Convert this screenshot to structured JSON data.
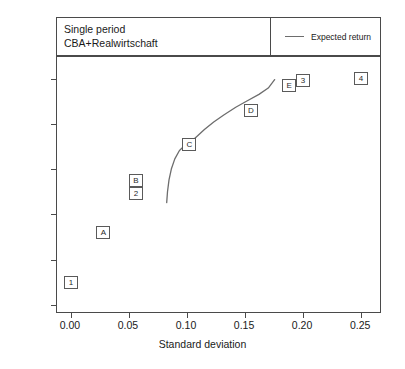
{
  "header": {
    "title_lines": [
      "Single period",
      "CBA+Realwirtschaft"
    ],
    "legend": {
      "label": "Expected return",
      "color": "#6d6d6d"
    }
  },
  "axes": {
    "x_title": "Standard deviation",
    "x_ticks": [
      "0.00",
      "0.05",
      "0.10",
      "0.15",
      "0.20",
      "0.25"
    ],
    "y_ticks": [
      "0.00",
      "0.02",
      "0.04",
      "0.06",
      "0.08",
      "0.10"
    ]
  },
  "chart_data": {
    "type": "scatter",
    "title": "Single period CBA+Realwirtschaft",
    "xlabel": "Standard deviation",
    "ylabel": "",
    "xlim": [
      -0.012,
      0.268
    ],
    "ylim": [
      -0.004,
      0.1095
    ],
    "grid": false,
    "legend_position": "top-right",
    "legend": [
      {
        "name": "Expected return",
        "type": "line",
        "color": "#6d6d6d"
      }
    ],
    "points": [
      {
        "label": "1",
        "x": 0.0,
        "y": 0.01
      },
      {
        "label": "A",
        "x": 0.028,
        "y": 0.032
      },
      {
        "label": "B",
        "x": 0.056,
        "y": 0.055
      },
      {
        "label": "2",
        "x": 0.056,
        "y": 0.049
      },
      {
        "label": "C",
        "x": 0.102,
        "y": 0.071
      },
      {
        "label": "D",
        "x": 0.155,
        "y": 0.086
      },
      {
        "label": "E",
        "x": 0.188,
        "y": 0.097
      },
      {
        "label": "3",
        "x": 0.2,
        "y": 0.099
      },
      {
        "label": "4",
        "x": 0.25,
        "y": 0.1
      }
    ],
    "series": [
      {
        "name": "Expected return",
        "type": "line",
        "color": "#6d6d6d",
        "x": [
          0.0825,
          0.0832,
          0.0845,
          0.0865,
          0.0895,
          0.0935,
          0.0985,
          0.102,
          0.108,
          0.115,
          0.123,
          0.132,
          0.142,
          0.152,
          0.162,
          0.17,
          0.1755
        ],
        "y": [
          0.0452,
          0.05,
          0.0552,
          0.06,
          0.0645,
          0.0682,
          0.0706,
          0.0714,
          0.0742,
          0.0775,
          0.0808,
          0.084,
          0.0873,
          0.0902,
          0.093,
          0.0958,
          0.0995
        ]
      }
    ]
  }
}
